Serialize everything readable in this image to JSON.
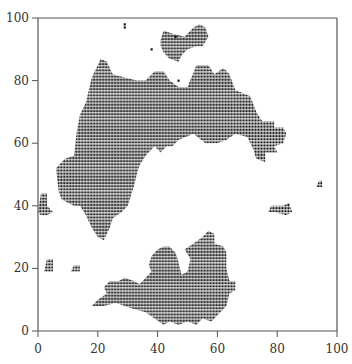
{
  "chart_data": {
    "type": "scatter",
    "title": "",
    "xlabel": "",
    "ylabel": "",
    "xlim": [
      0,
      100
    ],
    "ylim": [
      0,
      100
    ],
    "grid": false,
    "legend": null,
    "x_ticks": [
      0,
      20,
      40,
      60,
      80,
      100
    ],
    "y_ticks": [
      0,
      20,
      40,
      60,
      80,
      100
    ],
    "marker": "square",
    "lattice_spacing": 1,
    "point_color": "#111111",
    "regions": [
      {
        "name": "upper-main-cluster",
        "polygon": [
          [
            20,
            85
          ],
          [
            21,
            87
          ],
          [
            23,
            86
          ],
          [
            25,
            82
          ],
          [
            29,
            81
          ],
          [
            33,
            80
          ],
          [
            36,
            80
          ],
          [
            39,
            83
          ],
          [
            42,
            83
          ],
          [
            44,
            80
          ],
          [
            47,
            78
          ],
          [
            50,
            78
          ],
          [
            53,
            85
          ],
          [
            57,
            85
          ],
          [
            59,
            82
          ],
          [
            62,
            84
          ],
          [
            64,
            82
          ],
          [
            66,
            77
          ],
          [
            71,
            75
          ],
          [
            73,
            70
          ],
          [
            75,
            67
          ],
          [
            79,
            67
          ],
          [
            79,
            65
          ],
          [
            82,
            65
          ],
          [
            83,
            63
          ],
          [
            82,
            60
          ],
          [
            79,
            59
          ],
          [
            80,
            57
          ],
          [
            76,
            57
          ],
          [
            76,
            54
          ],
          [
            73,
            55
          ],
          [
            72,
            58
          ],
          [
            70,
            62
          ],
          [
            66,
            63
          ],
          [
            63,
            61
          ],
          [
            60,
            60
          ],
          [
            56,
            60
          ],
          [
            52,
            63
          ],
          [
            47,
            61
          ],
          [
            45,
            59
          ],
          [
            43,
            59
          ],
          [
            41,
            57
          ],
          [
            39,
            59
          ],
          [
            36,
            56
          ],
          [
            34,
            53
          ],
          [
            33,
            50
          ],
          [
            32,
            46
          ],
          [
            31,
            43
          ],
          [
            30,
            40
          ],
          [
            28,
            38
          ],
          [
            25,
            36
          ],
          [
            24,
            33
          ],
          [
            22,
            29
          ],
          [
            20,
            30
          ],
          [
            18,
            33
          ],
          [
            16,
            37
          ],
          [
            14,
            40
          ],
          [
            12,
            40
          ],
          [
            10,
            41
          ],
          [
            8,
            42
          ],
          [
            7,
            44
          ],
          [
            6,
            52
          ],
          [
            9,
            55
          ],
          [
            12,
            56
          ],
          [
            13,
            64
          ],
          [
            14,
            69
          ],
          [
            16,
            73
          ],
          [
            17,
            77
          ],
          [
            18,
            81
          ]
        ]
      },
      {
        "name": "upper-island",
        "polygon": [
          [
            41,
            93
          ],
          [
            42,
            96
          ],
          [
            45,
            95
          ],
          [
            49,
            94
          ],
          [
            50,
            95
          ],
          [
            52,
            97
          ],
          [
            54,
            98
          ],
          [
            56,
            97
          ],
          [
            57,
            94
          ],
          [
            55,
            91
          ],
          [
            53,
            91
          ],
          [
            50,
            90
          ],
          [
            48,
            88
          ],
          [
            47,
            86
          ],
          [
            44,
            87
          ],
          [
            42,
            89
          ],
          [
            41,
            91
          ]
        ]
      },
      {
        "name": "lower-cluster",
        "polygon": [
          [
            18,
            8
          ],
          [
            20,
            10
          ],
          [
            23,
            12
          ],
          [
            22,
            14
          ],
          [
            24,
            16
          ],
          [
            27,
            16
          ],
          [
            29,
            17
          ],
          [
            32,
            16
          ],
          [
            34,
            15
          ],
          [
            36,
            17
          ],
          [
            38,
            19
          ],
          [
            37,
            21
          ],
          [
            38,
            24
          ],
          [
            40,
            26
          ],
          [
            42,
            27
          ],
          [
            44,
            27
          ],
          [
            46,
            25
          ],
          [
            47,
            22
          ],
          [
            48,
            18
          ],
          [
            50,
            19
          ],
          [
            51,
            23
          ],
          [
            49,
            26
          ],
          [
            52,
            28
          ],
          [
            55,
            30
          ],
          [
            57,
            32
          ],
          [
            59,
            31
          ],
          [
            59,
            28
          ],
          [
            62,
            27
          ],
          [
            63,
            25
          ],
          [
            63,
            20
          ],
          [
            64,
            16
          ],
          [
            66,
            16
          ],
          [
            66,
            13
          ],
          [
            64,
            12
          ],
          [
            63,
            8
          ],
          [
            61,
            6
          ],
          [
            58,
            3
          ],
          [
            55,
            4
          ],
          [
            53,
            2
          ],
          [
            50,
            3
          ],
          [
            47,
            2
          ],
          [
            44,
            3
          ],
          [
            42,
            2
          ],
          [
            39,
            4
          ],
          [
            36,
            6
          ],
          [
            32,
            7
          ],
          [
            29,
            8
          ],
          [
            26,
            9
          ],
          [
            22,
            8
          ]
        ]
      },
      {
        "name": "left-fragment",
        "polygon": [
          [
            0,
            38
          ],
          [
            1,
            44
          ],
          [
            3,
            44
          ],
          [
            3,
            40
          ],
          [
            5,
            38
          ],
          [
            3,
            37
          ],
          [
            1,
            37
          ]
        ]
      },
      {
        "name": "lower-left-fragment",
        "polygon": [
          [
            2,
            19
          ],
          [
            3,
            23
          ],
          [
            5,
            23
          ],
          [
            5,
            19
          ]
        ]
      },
      {
        "name": "small-fragment-1",
        "polygon": [
          [
            11,
            19
          ],
          [
            12,
            21
          ],
          [
            14,
            21
          ],
          [
            14,
            19
          ]
        ]
      },
      {
        "name": "right-fragment",
        "polygon": [
          [
            77,
            38
          ],
          [
            78,
            40
          ],
          [
            82,
            40
          ],
          [
            84,
            41
          ],
          [
            85,
            38
          ],
          [
            83,
            37
          ],
          [
            79,
            38
          ]
        ]
      },
      {
        "name": "far-right-fragment",
        "polygon": [
          [
            93,
            46
          ],
          [
            94,
            48
          ],
          [
            95,
            48
          ],
          [
            95,
            46
          ]
        ]
      }
    ],
    "isolated_points": [
      [
        29,
        97
      ],
      [
        29,
        98
      ],
      [
        38,
        90
      ],
      [
        47,
        80
      ],
      [
        46,
        94
      ]
    ]
  }
}
